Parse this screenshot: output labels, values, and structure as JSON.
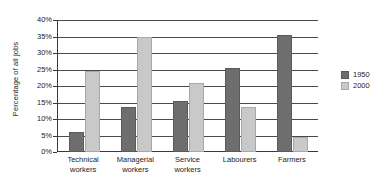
{
  "chart_data": {
    "type": "bar",
    "title": "",
    "subtitle": "",
    "xlabel": "",
    "ylabel": "Percentage of all jobs",
    "ylim": [
      0,
      40
    ],
    "ytick_values": [
      0,
      5,
      10,
      15,
      20,
      25,
      30,
      35,
      40
    ],
    "ytick_labels": [
      "0%",
      "5%",
      "10%",
      "15%",
      "20%",
      "25%",
      "30%",
      "35%",
      "40%"
    ],
    "grid": true,
    "legend_position": "right",
    "categories": [
      "Technical workers",
      "Managerial workers",
      "Service workers",
      "Labourers",
      "Farmers"
    ],
    "category_lines": [
      [
        "Technical",
        "workers"
      ],
      [
        "Managerial",
        "workers"
      ],
      [
        "Service",
        "workers"
      ],
      [
        "Labourers",
        ""
      ],
      [
        "Farmers",
        ""
      ]
    ],
    "series": [
      {
        "name": "1950",
        "color": "#6e6e6e",
        "values": [
          6,
          13.5,
          15.5,
          25.5,
          35.5
        ]
      },
      {
        "name": "2000",
        "color": "#c9c9c9",
        "values": [
          24.5,
          35,
          21,
          13.5,
          4.5
        ]
      }
    ]
  }
}
